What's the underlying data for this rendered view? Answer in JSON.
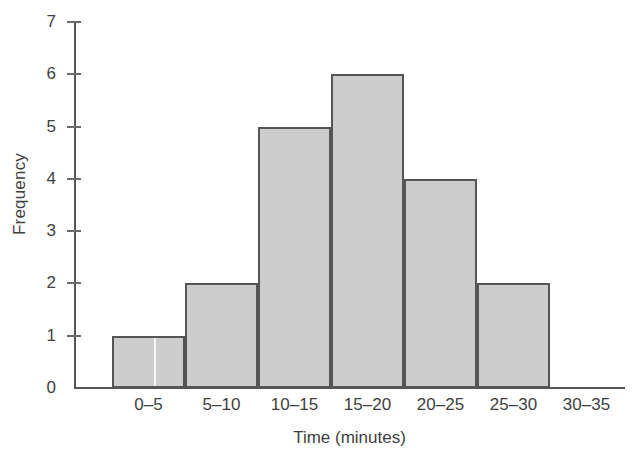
{
  "chart_data": {
    "type": "bar",
    "title": "",
    "subtitle": "",
    "xlabel": "Time (minutes)",
    "ylabel": "Frequency",
    "categories": [
      "0–5",
      "5–10",
      "10–15",
      "15–20",
      "20–25",
      "25–30",
      "30–35"
    ],
    "values": [
      1,
      2,
      5,
      6,
      4,
      2,
      0
    ],
    "ylim": [
      0,
      7
    ],
    "yticks": [
      0,
      1,
      2,
      3,
      4,
      5,
      6,
      7
    ],
    "ytick_labels": [
      "0",
      "1",
      "2",
      "3",
      "4",
      "5",
      "6",
      "7"
    ],
    "grid": false,
    "legend": null,
    "legend_position": "none",
    "bar_fill_color": "#cdcdcd",
    "bar_edge_color": "#555555",
    "axis_color": "#555555",
    "text_color": "#3f3f3f",
    "background_color": "#ffffff",
    "annotations": []
  }
}
